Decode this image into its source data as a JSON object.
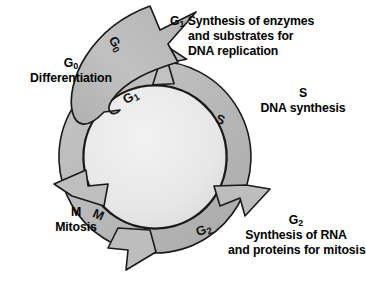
{
  "diagram": {
    "type": "cycle-diagram",
    "background_color": "#ffffff",
    "ring": {
      "fill_color": "#b9b9b9",
      "interior_color": "#e9e9e9",
      "outline_color": "#1a1a1a",
      "center_x": 155,
      "center_y": 157,
      "outer_radius": 96,
      "inner_radius": 72,
      "direction": "clockwise"
    },
    "branch_arrow": {
      "name": "g0-branch-arrow",
      "fill_color": "#bcbcbc",
      "outline_color": "#1a1a1a",
      "from": "ring upper-left",
      "to": "upper right, exits cycle"
    },
    "phases": [
      {
        "id": "g0",
        "ring_letter": "G",
        "ring_subscript": "0",
        "heading": "G",
        "heading_subscript": "0",
        "lines": [
          "Differentiation"
        ]
      },
      {
        "id": "g1",
        "ring_letter": "G",
        "ring_subscript": "1",
        "heading": "G",
        "heading_subscript": "1",
        "lines": [
          "Synthesis of enzymes",
          "and substrates for",
          "DNA replication"
        ]
      },
      {
        "id": "s",
        "ring_letter": "S",
        "ring_subscript": "",
        "heading": "S",
        "heading_subscript": "",
        "lines": [
          "DNA synthesis"
        ]
      },
      {
        "id": "g2",
        "ring_letter": "G",
        "ring_subscript": "2",
        "heading": "G",
        "heading_subscript": "2",
        "lines": [
          "Synthesis of RNA",
          "and proteins for mitosis"
        ]
      },
      {
        "id": "m",
        "ring_letter": "M",
        "ring_subscript": "",
        "heading": "M",
        "heading_subscript": "",
        "lines": [
          "Mitosis"
        ]
      }
    ],
    "labels": {
      "g0_heading": "G",
      "g0_sub": "0",
      "g0_line1": "Differentiation",
      "g1_heading": "G",
      "g1_sub": "1",
      "g1_line1": "Synthesis of enzymes",
      "g1_line2": "and substrates for",
      "g1_line3": "DNA replication",
      "s_heading": "S",
      "s_line1": "DNA synthesis",
      "g2_heading": "G",
      "g2_sub": "2",
      "g2_line1": "Synthesis of RNA",
      "g2_line2": "and proteins for mitosis",
      "m_heading": "M",
      "m_line1": "Mitosis",
      "ring_g0": "G",
      "ring_g0_sub": "0",
      "ring_g1": "G",
      "ring_g1_sub": "1",
      "ring_s": "S",
      "ring_g2": "G",
      "ring_g2_sub": "2",
      "ring_m": "M"
    }
  }
}
